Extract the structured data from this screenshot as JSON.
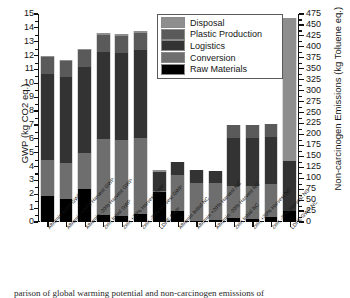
{
  "chart_data": {
    "type": "bar",
    "subtype": "stacked",
    "title": "",
    "xlabel": "",
    "ylabel": "GWP (kg CO2 eq.)",
    "y2label": "Non-carcinogen Emissions (kg Toluene eq.)",
    "ylim": [
      0,
      15
    ],
    "y2lim": [
      0,
      475
    ],
    "ytick_step": 1,
    "y2tick_step": 25,
    "yticks": [
      "0",
      "1",
      "2",
      "3",
      "4",
      "5",
      "6",
      "7",
      "8",
      "9",
      "10",
      "11",
      "12",
      "13",
      "14",
      "15"
    ],
    "y2ticks": [
      "0",
      "25",
      "50",
      "75",
      "100",
      "125",
      "150",
      "175",
      "200",
      "225",
      "250",
      "275",
      "300",
      "325",
      "350",
      "375",
      "400",
      "425",
      "450",
      "475"
    ],
    "grid": false,
    "legend_position": "top-center",
    "legend": [
      "Disposal",
      "Plastic Production",
      "Logistics",
      "Conversion",
      "Raw Materials"
    ],
    "series_colors": {
      "Disposal": "#8e8e8e",
      "Plastic Production": "#5a5a5a",
      "Logistics": "#333333",
      "Conversion": "#6e6e6e",
      "Raw Materials": "#000000"
    },
    "categories": [
      "Albumin Initial GWP",
      "Albumin +20% Harvest GWP",
      "Albumin -20% Harvest GWP",
      "Zein Initial GWP",
      "Zein +20% Harvest GWP",
      "Zein -20% Harvest GWP",
      "LDPE GWP",
      "Albumin Initial NC",
      "Albumin +20% Harvest NC",
      "Albumin -20% Harvest NC",
      "Zein Initial NC",
      "Zein +20% Harvest NC",
      "Zein -20% Harvest NC",
      "LDPE GWP NC"
    ],
    "axis_assignment": [
      "left",
      "left",
      "left",
      "left",
      "left",
      "left",
      "left",
      "right",
      "right",
      "right",
      "right",
      "right",
      "right",
      "right"
    ],
    "series": [
      {
        "name": "Raw Materials",
        "values": [
          1.9,
          1.65,
          2.35,
          0.5,
          0.45,
          0.6,
          2.15,
          25,
          3,
          4,
          9,
          7,
          11,
          25
        ]
      },
      {
        "name": "Conversion",
        "values": [
          2.6,
          2.6,
          2.6,
          5.5,
          5.45,
          5.45,
          0.1,
          83,
          86,
          84,
          74,
          75,
          76,
          0
        ]
      },
      {
        "name": "Logistics",
        "values": [
          6.2,
          6.2,
          6.25,
          6.25,
          6.3,
          6.35,
          1.35,
          30,
          29,
          29,
          109,
          110,
          108,
          115
        ]
      },
      {
        "name": "Plastic Production",
        "values": [
          1.2,
          1.2,
          1.2,
          1.25,
          1.25,
          1.25,
          0.0,
          0,
          0,
          0,
          30,
          30,
          30,
          0
        ]
      },
      {
        "name": "Disposal",
        "values": [
          0.1,
          0.05,
          0.1,
          0.1,
          0.1,
          0.1,
          0.15,
          0,
          0,
          0,
          0,
          0,
          0,
          325
        ]
      }
    ],
    "totals_left_axis": [
      12.0,
      11.7,
      12.5,
      13.6,
      13.55,
      13.75,
      3.75,
      null,
      null,
      null,
      null,
      null,
      null,
      null
    ],
    "totals_right_axis": [
      null,
      null,
      null,
      null,
      null,
      null,
      null,
      138,
      118,
      117,
      222,
      222,
      225,
      465
    ]
  },
  "legend": {
    "items": [
      {
        "label": "Disposal",
        "color": "#8e8e8e"
      },
      {
        "label": "Plastic Production",
        "color": "#5a5a5a"
      },
      {
        "label": "Logistics",
        "color": "#333333"
      },
      {
        "label": "Conversion",
        "color": "#6e6e6e"
      },
      {
        "label": "Raw Materials",
        "color": "#000000"
      }
    ]
  },
  "caption": {
    "text": "parison of global warming potential and non-carcinogen emissions of"
  }
}
